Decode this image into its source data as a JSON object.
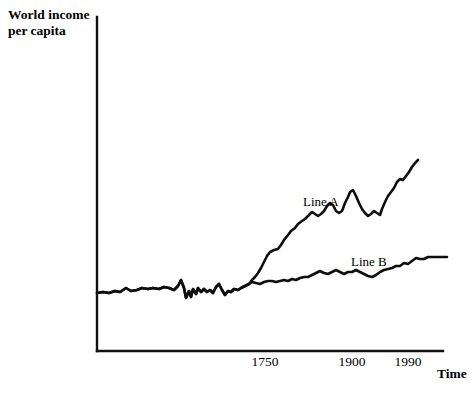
{
  "chart_data": {
    "type": "line",
    "title": "",
    "subtitle": "",
    "ylabel": "World income\nper capita",
    "ylabel_line1": "World income",
    "ylabel_line2": "per capita",
    "xlabel": "Time",
    "grid": false,
    "legend_position": "inline-annotations",
    "annotations": [
      {
        "text": "Line A",
        "x_px": 303,
        "y_px": 194
      },
      {
        "text": "Line B",
        "x_px": 351,
        "y_px": 254
      }
    ],
    "xticks": [
      {
        "label": "1750",
        "x_px": 265
      },
      {
        "label": "1900",
        "x_px": 352
      },
      {
        "label": "1990",
        "x_px": 408
      }
    ],
    "yticks": [],
    "xlim_px": [
      97,
      443
    ],
    "ylim_px": [
      351,
      17
    ],
    "axis_color": "#111111",
    "line_color": "#0d0d0d",
    "background_color": "#ffffff",
    "series": [
      {
        "name": "Line A",
        "description": "Shared flat pre-industrial base that diverges upward sharply after 1750 (hockey-stick growth).",
        "points_px": [
          [
            97,
            293
          ],
          [
            103,
            292
          ],
          [
            109,
            293
          ],
          [
            115,
            291
          ],
          [
            120,
            292
          ],
          [
            126,
            288
          ],
          [
            131,
            291
          ],
          [
            137,
            290
          ],
          [
            142,
            288
          ],
          [
            148,
            289
          ],
          [
            153,
            288
          ],
          [
            159,
            289
          ],
          [
            164,
            287
          ],
          [
            169,
            288
          ],
          [
            174,
            290
          ],
          [
            178,
            286
          ],
          [
            181,
            280
          ],
          [
            184,
            288
          ],
          [
            186,
            298
          ],
          [
            189,
            291
          ],
          [
            191,
            297
          ],
          [
            193,
            289
          ],
          [
            196,
            294
          ],
          [
            198,
            288
          ],
          [
            201,
            292
          ],
          [
            204,
            289
          ],
          [
            207,
            292
          ],
          [
            210,
            290
          ],
          [
            213,
            293
          ],
          [
            216,
            287
          ],
          [
            219,
            284
          ],
          [
            222,
            290
          ],
          [
            225,
            295
          ],
          [
            228,
            291
          ],
          [
            231,
            292
          ],
          [
            234,
            289
          ],
          [
            238,
            290
          ],
          [
            241,
            288
          ],
          [
            245,
            286
          ],
          [
            249,
            284
          ],
          [
            252,
            280
          ],
          [
            255,
            277
          ],
          [
            258,
            273
          ],
          [
            261,
            268
          ],
          [
            264,
            262
          ],
          [
            267,
            256
          ],
          [
            270,
            252
          ],
          [
            274,
            250
          ],
          [
            278,
            249
          ],
          [
            281,
            245
          ],
          [
            284,
            240
          ],
          [
            288,
            235
          ],
          [
            291,
            231
          ],
          [
            295,
            228
          ],
          [
            298,
            224
          ],
          [
            302,
            221
          ],
          [
            305,
            219
          ],
          [
            309,
            215
          ],
          [
            312,
            212
          ],
          [
            315,
            214
          ],
          [
            318,
            216
          ],
          [
            321,
            214
          ],
          [
            324,
            211
          ],
          [
            327,
            206
          ],
          [
            330,
            203
          ],
          [
            333,
            205
          ],
          [
            336,
            211
          ],
          [
            339,
            213
          ],
          [
            342,
            211
          ],
          [
            345,
            203
          ],
          [
            348,
            197
          ],
          [
            350,
            192
          ],
          [
            353,
            190
          ],
          [
            356,
            196
          ],
          [
            359,
            203
          ],
          [
            362,
            209
          ],
          [
            365,
            213
          ],
          [
            368,
            216
          ],
          [
            371,
            214
          ],
          [
            374,
            211
          ],
          [
            377,
            213
          ],
          [
            380,
            215
          ],
          [
            382,
            209
          ],
          [
            385,
            202
          ],
          [
            388,
            196
          ],
          [
            391,
            192
          ],
          [
            394,
            188
          ],
          [
            397,
            182
          ],
          [
            400,
            179
          ],
          [
            403,
            180
          ],
          [
            406,
            176
          ],
          [
            409,
            172
          ],
          [
            412,
            167
          ],
          [
            415,
            163
          ],
          [
            418,
            160
          ]
        ]
      },
      {
        "name": "Line B",
        "description": "Shared flat pre-industrial base that rises only gently and almost linearly after 1750.",
        "points_px": [
          [
            97,
            293
          ],
          [
            103,
            292
          ],
          [
            109,
            293
          ],
          [
            115,
            291
          ],
          [
            120,
            292
          ],
          [
            126,
            288
          ],
          [
            131,
            291
          ],
          [
            137,
            290
          ],
          [
            142,
            288
          ],
          [
            148,
            289
          ],
          [
            153,
            288
          ],
          [
            159,
            289
          ],
          [
            164,
            287
          ],
          [
            169,
            288
          ],
          [
            174,
            290
          ],
          [
            178,
            286
          ],
          [
            181,
            280
          ],
          [
            184,
            288
          ],
          [
            186,
            298
          ],
          [
            189,
            291
          ],
          [
            191,
            297
          ],
          [
            193,
            289
          ],
          [
            196,
            294
          ],
          [
            198,
            288
          ],
          [
            201,
            292
          ],
          [
            204,
            289
          ],
          [
            207,
            292
          ],
          [
            210,
            290
          ],
          [
            213,
            293
          ],
          [
            216,
            287
          ],
          [
            219,
            284
          ],
          [
            222,
            290
          ],
          [
            225,
            295
          ],
          [
            228,
            291
          ],
          [
            231,
            292
          ],
          [
            234,
            289
          ],
          [
            238,
            290
          ],
          [
            241,
            288
          ],
          [
            245,
            286
          ],
          [
            249,
            284
          ],
          [
            252,
            282
          ],
          [
            256,
            283
          ],
          [
            260,
            284
          ],
          [
            264,
            282
          ],
          [
            268,
            281
          ],
          [
            272,
            281
          ],
          [
            276,
            282
          ],
          [
            280,
            281
          ],
          [
            284,
            280
          ],
          [
            288,
            281
          ],
          [
            292,
            279
          ],
          [
            296,
            280
          ],
          [
            300,
            278
          ],
          [
            304,
            277
          ],
          [
            308,
            277
          ],
          [
            312,
            275
          ],
          [
            316,
            273
          ],
          [
            320,
            271
          ],
          [
            324,
            273
          ],
          [
            328,
            274
          ],
          [
            332,
            272
          ],
          [
            336,
            270
          ],
          [
            340,
            272
          ],
          [
            344,
            274
          ],
          [
            348,
            272
          ],
          [
            352,
            272
          ],
          [
            356,
            270
          ],
          [
            360,
            272
          ],
          [
            364,
            274
          ],
          [
            368,
            276
          ],
          [
            372,
            277
          ],
          [
            376,
            275
          ],
          [
            380,
            272
          ],
          [
            384,
            270
          ],
          [
            388,
            269
          ],
          [
            392,
            268
          ],
          [
            396,
            266
          ],
          [
            400,
            266
          ],
          [
            404,
            263
          ],
          [
            408,
            264
          ],
          [
            412,
            261
          ],
          [
            416,
            258
          ],
          [
            420,
            259
          ],
          [
            424,
            259
          ],
          [
            428,
            257
          ],
          [
            433,
            257
          ],
          [
            438,
            257
          ],
          [
            443,
            257
          ],
          [
            447,
            257
          ]
        ]
      }
    ]
  }
}
